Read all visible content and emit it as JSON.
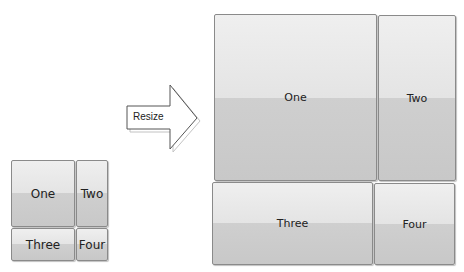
{
  "diagram": {
    "before": {
      "tiles": [
        {
          "label": "One"
        },
        {
          "label": "Two"
        },
        {
          "label": "Three"
        },
        {
          "label": "Four"
        }
      ]
    },
    "arrow": {
      "label": "Resize"
    },
    "after": {
      "tiles": [
        {
          "label": "One"
        },
        {
          "label": "Two"
        },
        {
          "label": "Three"
        },
        {
          "label": "Four"
        }
      ]
    },
    "colors": {
      "tile_top": "#efefef",
      "tile_bottom": "#cccccc",
      "tile_border": "#8a8a8a"
    }
  }
}
